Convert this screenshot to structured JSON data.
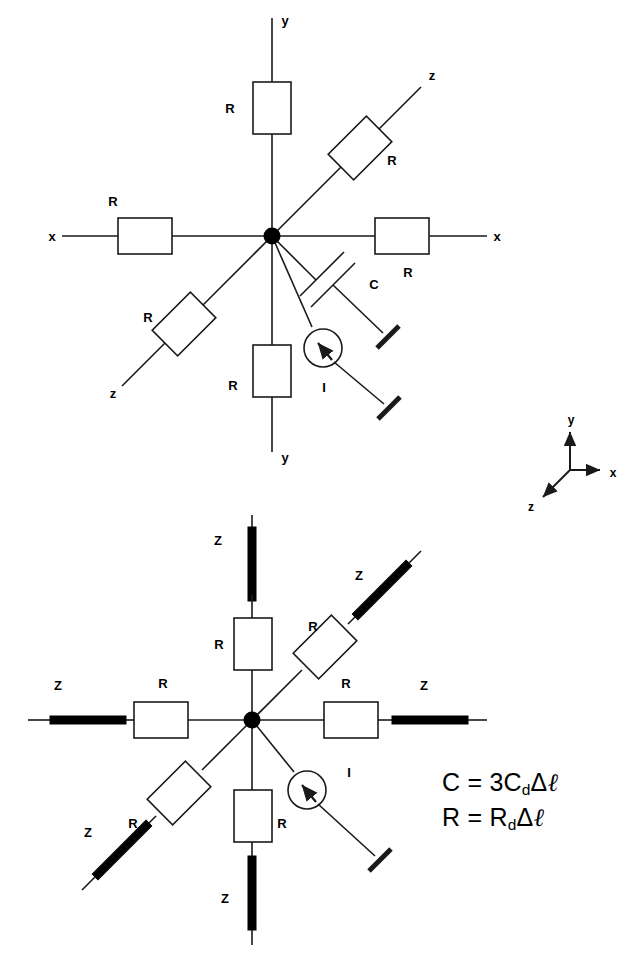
{
  "figure": {
    "title_text": "",
    "colors": {
      "stroke": "#1a1a1a",
      "fill_white": "#ffffff",
      "fill_black": "#000000"
    }
  },
  "top_diagram": {
    "name": "lumped-rc-node-model",
    "center_node_label": "",
    "axis_labels": {
      "y_up": "y",
      "y_down": "y",
      "x_left": "x",
      "x_right": "x",
      "z_upper_right": "z",
      "z_lower_left": "z"
    },
    "resistor_labels": {
      "up": "R",
      "down": "R",
      "left": "R",
      "right": "R",
      "diag_upper_right": "R",
      "diag_lower_left": "R"
    },
    "capacitor_label": "C",
    "current_source_label": "I"
  },
  "axis_legend": {
    "name": "coordinate-axis-legend",
    "y": "y",
    "x": "x",
    "z": "z"
  },
  "bottom_diagram": {
    "name": "distributed-rz-node-model",
    "impedance_labels": {
      "up": "Z",
      "down": "Z",
      "left": "Z",
      "right": "Z",
      "diag_upper_right": "Z",
      "diag_lower_left": "Z"
    },
    "resistor_labels": {
      "up": "R",
      "down": "R",
      "left": "R",
      "right": "R",
      "diag_upper_right": "R",
      "diag_lower_left": "R"
    },
    "current_source_label": "I"
  },
  "equations": {
    "name": "component-value-equations",
    "line1": {
      "lhs": "C",
      "eq": "=",
      "coeff": "3",
      "sym": "C",
      "sub": "d",
      "delta": "Δ",
      "ell": "ℓ"
    },
    "line2": {
      "lhs": "R",
      "eq": "=",
      "coeff": "",
      "sym": "R",
      "sub": "d",
      "delta": "Δ",
      "ell": "ℓ"
    }
  }
}
